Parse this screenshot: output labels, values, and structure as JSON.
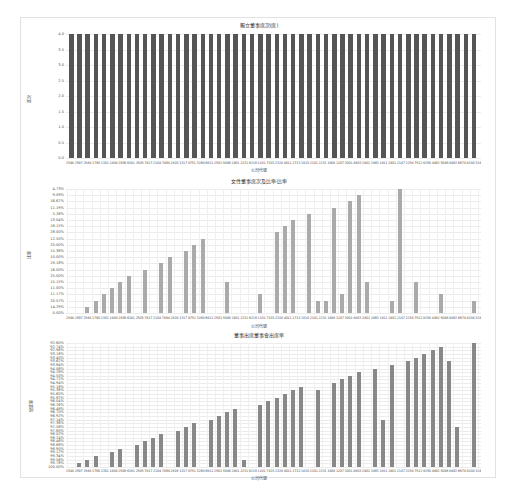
{
  "chart_data": [
    {
      "type": "bar",
      "title": "獨立董事席次(席)",
      "xlabel": "公司代號",
      "ylabel": "席次",
      "ylim": [
        0,
        4.0
      ],
      "yticks": [
        "0.0",
        "0.5",
        "1.0",
        "1.5",
        "2.0",
        "2.5",
        "3.0",
        "3.5",
        "4.0"
      ],
      "grid": true,
      "bar_color": "#555555",
      "num_categories": 50,
      "values": [
        4,
        4,
        4,
        4,
        4,
        4,
        4,
        4,
        4,
        4,
        4,
        4,
        4,
        4,
        4,
        4,
        4,
        4,
        4,
        4,
        4,
        4,
        4,
        4,
        4,
        4,
        4,
        4,
        4,
        4,
        4,
        4,
        4,
        4,
        4,
        4,
        4,
        4,
        4,
        4,
        4,
        4,
        4,
        4,
        4,
        4,
        4,
        4,
        4,
        4
      ]
    },
    {
      "type": "bar",
      "title": "女性董事席次及比率-比率",
      "xlabel": "公司代號",
      "ylabel": "比率",
      "y_axis_type": "category",
      "yticks": [
        "0.00%",
        "14.29%",
        "20.57%",
        "11.17%",
        "11.00%",
        "15.15%",
        "25.00%",
        "16.00%",
        "19.18%",
        "10.00%",
        "15.38%",
        "20.00%",
        "12.50%",
        "28.00%",
        "18.15%",
        "13.04%",
        "5.26%",
        "11.19%",
        "16.67%",
        "9.09%",
        "4.73%"
      ],
      "grid": true,
      "bar_color": "#aaaaaa",
      "num_categories": 50,
      "level_index": [
        0,
        0,
        1,
        2,
        3,
        4,
        5,
        6,
        0,
        7,
        0,
        8,
        9,
        0,
        10,
        11,
        12,
        0,
        0,
        5,
        0,
        0,
        0,
        3,
        0,
        13,
        14,
        15,
        0,
        16,
        2,
        2,
        17,
        3,
        18,
        19,
        5,
        0,
        0,
        2,
        20,
        0,
        5,
        0,
        0,
        3,
        0,
        0,
        0,
        2
      ]
    },
    {
      "type": "bar",
      "title": "董事出席董事會出席率",
      "xlabel": "公司代號",
      "ylabel": "出席率",
      "y_axis_type": "category",
      "yticks_top": "92.60%",
      "yticks_bottom": "100.00%",
      "num_yticks": 34,
      "grid": true,
      "bar_color": "#888888",
      "num_categories": 50,
      "level_index": [
        0,
        1,
        2,
        3,
        0,
        4,
        5,
        0,
        6,
        7,
        8,
        9,
        0,
        10,
        11,
        12,
        0,
        13,
        14,
        15,
        16,
        2,
        0,
        17,
        18,
        19,
        20,
        21,
        22,
        0,
        21,
        0,
        23,
        24,
        25,
        26,
        0,
        27,
        13,
        28,
        0,
        29,
        30,
        31,
        32,
        33,
        29,
        11,
        0,
        34
      ]
    }
  ],
  "charts": {
    "c1": {
      "title": "獨立董事席次(席)",
      "ylabel": "席次",
      "xtitle": "公司代號",
      "xlabels": "2548 2597 2548 1790 1301 1808 2506 6281 2505 7817 2104 7894 2819 1317 8751 3260 6811 2501 5049 2401 2231 6219 1101 7103 2324 4011 1713 1810 2101 2231 1808 1207 3001 4803 2402 2463 1811 2401 2147 2254 7512 8250 4492 5046 8492 6674 8204 3247 9051 8412 2417"
    },
    "c2": {
      "title": "女性董事席次及比率-比率",
      "ylabel": "比率",
      "xtitle": "公司代號",
      "xlabels": "2548 2597 2548 1790 1301 1808 2506 6281 2505 7817 2104 7894 2819 1317 8751 3260 6811 2501 5049 2401 2231 6219 1101 7103 2324 4011 1713 1810 2101 2231 1808 1207 3001 4803 2402 2463 1811 2401 2147 2254 7512 8250 4492 5046 8492 6674 8204 3247 9051 8412 2417"
    },
    "c3": {
      "title": "董事出席董事會出席率",
      "ylabel": "出席率",
      "xtitle": "公司代號",
      "xlabels": "2548 2597 2548 1790 1301 1808 2506 6281 2505 7817 2104 7894 2819 1317 8751 3260 6811 2501 5049 2401 2231 6219 1101 7103 2324 4011 1713 1810 2101 2231 1808 1207 3001 4803 2402 2463 1811 2401 2147 2254 7512 8250 4492 5046 8492 6674 8204 3247 9051 8412 2417"
    }
  }
}
